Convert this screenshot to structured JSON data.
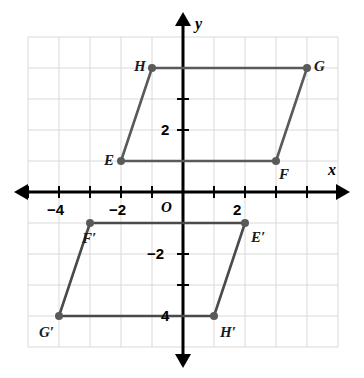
{
  "figure": {
    "origin_label": "O",
    "x_axis_label": "x",
    "y_axis_label": "y",
    "colors": {
      "axis": "#000000",
      "grid": "#d9d9d9",
      "shape_stroke": "#5a5a5a",
      "shape_stroke_image": "#4a4a4a",
      "point_fill": "#5a5a5a",
      "label_text": "#1a1a1a",
      "background": "#ffffff"
    },
    "axes": {
      "x_ticks": [
        {
          "value": -5,
          "label": ""
        },
        {
          "value": -4,
          "label": "−4"
        },
        {
          "value": -3,
          "label": ""
        },
        {
          "value": -2,
          "label": "−2"
        },
        {
          "value": -1,
          "label": ""
        },
        {
          "value": 1,
          "label": ""
        },
        {
          "value": 2,
          "label": "2"
        },
        {
          "value": 3,
          "label": ""
        },
        {
          "value": 4,
          "label": ""
        }
      ],
      "y_ticks": [
        {
          "value": 3,
          "label": ""
        },
        {
          "value": 2,
          "label": "2"
        },
        {
          "value": -2,
          "label": "−2"
        },
        {
          "value": -3,
          "label": ""
        },
        {
          "value": -4,
          "label": "4"
        }
      ],
      "x_range": [
        -5,
        4
      ],
      "y_range": [
        -5,
        5
      ],
      "unit_px": 31,
      "origin_px": {
        "x": 183,
        "y": 192
      }
    },
    "preimage": {
      "name": "EFGH",
      "vertices": [
        {
          "label": "E",
          "x": -2,
          "y": 1,
          "label_dx": -17,
          "label_dy": -8
        },
        {
          "label": "F",
          "x": 3,
          "y": 1,
          "label_dx": 3,
          "label_dy": 6
        },
        {
          "label": "G",
          "x": 4,
          "y": 4,
          "label_dx": 7,
          "label_dy": -9
        },
        {
          "label": "H",
          "x": -1,
          "y": 4,
          "label_dx": -18,
          "label_dy": -9
        }
      ]
    },
    "image": {
      "name": "E′F′G′H′",
      "vertices": [
        {
          "label": "E′",
          "x": 2,
          "y": -1,
          "label_dx": 6,
          "label_dy": 7
        },
        {
          "label": "F′",
          "x": -3,
          "y": -1,
          "label_dx": -8,
          "label_dy": 8
        },
        {
          "label": "G′",
          "x": -4,
          "y": -4,
          "label_dx": -20,
          "label_dy": 9
        },
        {
          "label": "H′",
          "x": 1,
          "y": -4,
          "label_dx": 6,
          "label_dy": 9
        }
      ]
    }
  }
}
